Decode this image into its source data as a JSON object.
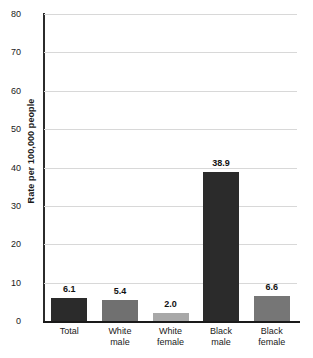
{
  "chart_data": {
    "type": "bar",
    "title": "",
    "subtitle": "",
    "xlabel": "",
    "ylabel": "Rate per 100,000 people",
    "ylim": [
      0,
      80
    ],
    "yticks": [
      0,
      10,
      20,
      30,
      40,
      50,
      60,
      70,
      80
    ],
    "ytick_labels": [
      "0",
      "10",
      "20",
      "30",
      "40",
      "50",
      "60",
      "70",
      "80"
    ],
    "grid": true,
    "legend": "none",
    "categories": [
      "Total",
      "White male",
      "White female",
      "Black male",
      "Black female"
    ],
    "category_lines": [
      [
        "Total",
        ""
      ],
      [
        "White",
        "male"
      ],
      [
        "White",
        "female"
      ],
      [
        "Black",
        "male"
      ],
      [
        "Black",
        "female"
      ]
    ],
    "values": [
      6.1,
      5.4,
      2.0,
      38.9,
      6.6
    ],
    "value_labels": [
      "6.1",
      "5.4",
      "2.0",
      "38.9",
      "6.6"
    ],
    "bar_colors": [
      "#2b2b2b",
      "#707070",
      "#a8a8a8",
      "#2b2b2b",
      "#767676"
    ]
  },
  "colors": {
    "background": "#ffffff",
    "gridline": "#d8d8d8",
    "axis": "#1a1a1a",
    "text": "#1a1a1a",
    "dark_bar": "#2b2b2b",
    "mid_bar": "#707070",
    "light_bar": "#a8a8a8"
  }
}
